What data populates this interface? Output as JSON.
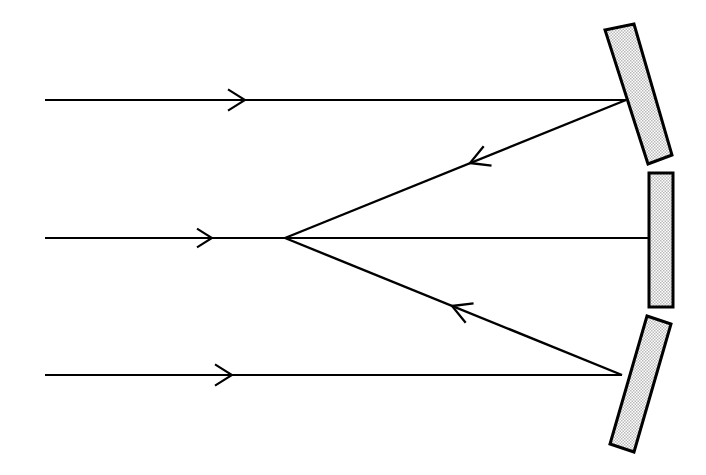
{
  "figure": {
    "kind": "ray-diagram",
    "canvas": {
      "width": 706,
      "height": 475
    },
    "background_color": "#ffffff",
    "ink_color": "#000000",
    "mirror_fill_color": "#d9d9d9",
    "mirror_fill_style": "stipple"
  },
  "focal_point": {
    "x": 285,
    "y": 238
  },
  "rays": {
    "incoming": [
      {
        "id": "incoming-ray-top",
        "label": "top incoming ray",
        "x1": 45,
        "y1": 100,
        "x2": 626,
        "y2": 100,
        "stroke_width": 2.2,
        "arrow": {
          "x": 245,
          "y": 100,
          "size": 17,
          "direction": "right"
        }
      },
      {
        "id": "incoming-ray-middle",
        "label": "middle incoming ray",
        "x1": 45,
        "y1": 238,
        "x2": 648,
        "y2": 238,
        "stroke_width": 2.2,
        "arrow": {
          "x": 212,
          "y": 238,
          "size": 15,
          "direction": "right"
        }
      },
      {
        "id": "incoming-ray-bottom",
        "label": "bottom incoming ray",
        "x1": 45,
        "y1": 375,
        "x2": 622,
        "y2": 375,
        "stroke_width": 2.2,
        "arrow": {
          "x": 232,
          "y": 375,
          "size": 17,
          "direction": "right"
        }
      }
    ],
    "reflected": [
      {
        "id": "reflected-ray-top",
        "label": "upper reflected ray to focus",
        "x1": 626,
        "y1": 100,
        "x2": 285,
        "y2": 238,
        "stroke_width": 2.4,
        "arrow": {
          "x": 470,
          "y": 163,
          "size": 19,
          "direction": "toward-focus"
        }
      },
      {
        "id": "reflected-ray-bottom",
        "label": "lower reflected ray to focus",
        "x1": 622,
        "y1": 375,
        "x2": 285,
        "y2": 238,
        "stroke_width": 2.4,
        "arrow": {
          "x": 452,
          "y": 306,
          "size": 19,
          "direction": "toward-focus"
        }
      }
    ]
  },
  "mirrors": [
    {
      "id": "mirror-top",
      "label": "upper tilted mirror segment",
      "orientation": "tilted-clockwise",
      "points": "605,30 634,24 672,155 648,164",
      "stroke_width": 3
    },
    {
      "id": "mirror-middle",
      "label": "central vertical mirror segment",
      "orientation": "vertical",
      "points": "649,173 673,173 673,307 649,307",
      "stroke_width": 3
    },
    {
      "id": "mirror-bottom",
      "label": "lower tilted mirror segment",
      "orientation": "tilted-counterclockwise",
      "points": "647,316 671,324 634,452 610,444",
      "stroke_width": 3
    }
  ]
}
